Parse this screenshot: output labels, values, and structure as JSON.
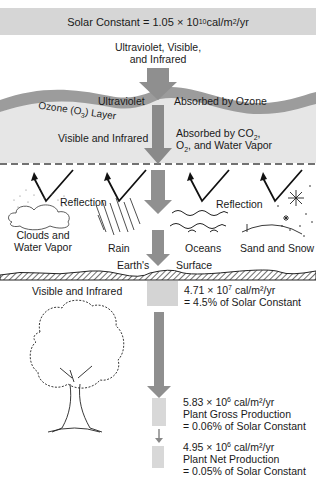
{
  "banner": {
    "prefix": "Solar Constant = 1.05 × 10",
    "exp": "10",
    "unit_a": " cal/m",
    "unit_sup": "2",
    "unit_b": "/yr"
  },
  "incoming_label": {
    "line1": "Ultraviolet, Visible,",
    "line2": "and Infrared"
  },
  "ozone": {
    "left_label": "Ultraviolet",
    "right_label": "Absorbed by Ozone",
    "layer_label": "Ozone (O3) Layer"
  },
  "atmosphere": {
    "left_label": "Visible and Infrared",
    "right_line1": "Absorbed by CO2,",
    "right_line2": "O2, and Water Vapor"
  },
  "reflection": {
    "label_left": "Reflection",
    "label_right": "Reflection",
    "surfaces": [
      {
        "line1": "Clouds and",
        "line2": "Water Vapor"
      },
      {
        "line1": "Rain",
        "line2": ""
      },
      {
        "line1": "Oceans",
        "line2": ""
      },
      {
        "line1": "Sand and Snow",
        "line2": ""
      }
    ]
  },
  "earth": {
    "left_label": "Earth's",
    "right_label": "Surface"
  },
  "surface_energy": {
    "left_label": "Visible and Infrared",
    "value_prefix": "4.71 × 10",
    "value_exp": "7",
    "value_unit": " cal/m²/yr",
    "percent": "= 4.5% of Solar Constant"
  },
  "gross_production": {
    "value_prefix": "5.83 × 10",
    "value_exp": "6",
    "value_unit": " cal/m²/yr",
    "label": "Plant Gross Production",
    "percent": "= 0.06% of Solar Constant"
  },
  "net_production": {
    "value_prefix": "4.95 × 10",
    "value_exp": "6",
    "value_unit": " cal/m²/yr",
    "label": "Plant Net Production",
    "percent": "= 0.05% of Solar Constant"
  },
  "colors": {
    "banner": "#d6d6d6",
    "arrow": "#8f8f8f",
    "ozone_band": "#9a9a9a",
    "atmosphere": "#e4e4e4",
    "box": "#d4d4d4"
  }
}
